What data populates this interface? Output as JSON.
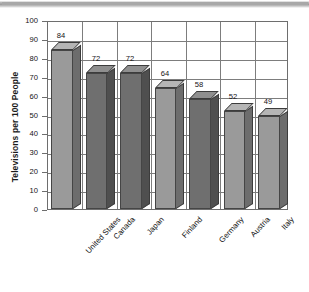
{
  "chart_data": {
    "type": "bar",
    "title": "",
    "xlabel": "",
    "ylabel": "Televisions per 100 People",
    "ylim": [
      0,
      100
    ],
    "ytick_step": 10,
    "yticks": [
      "100",
      "90",
      "80",
      "70",
      "60",
      "50",
      "40",
      "30",
      "20",
      "10",
      "0"
    ],
    "grid": "both",
    "legend": "none",
    "three_d": true,
    "categories": [
      "United States",
      "Canada",
      "Japan",
      "Finland",
      "Germany",
      "Austria",
      "Italy"
    ],
    "values": [
      84,
      72,
      72,
      64,
      58,
      52,
      49
    ],
    "data_labels": [
      "84",
      "72",
      "72",
      "64",
      "58",
      "52",
      "49"
    ],
    "bar_shades": [
      "light",
      "dark",
      "dark",
      "light",
      "dark",
      "light",
      "light"
    ],
    "colors": {
      "bar_front_light": "#9a9a9a",
      "bar_side_light": "#6d6d6d",
      "bar_top_light": "#b5b5b5",
      "bar_front_dark": "#6f6f6f",
      "bar_side_dark": "#4f4f4f",
      "bar_top_dark": "#8f8f8f",
      "grid": "#7d7d7d",
      "axis": "#6e6e6e",
      "text": "#141414",
      "background": "#ffffff"
    }
  }
}
